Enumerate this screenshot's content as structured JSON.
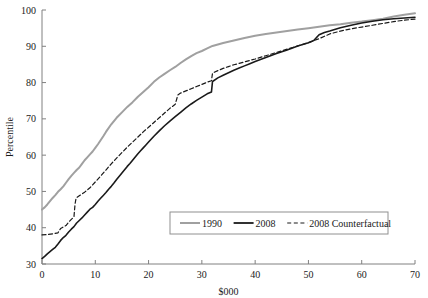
{
  "chart_data": {
    "type": "line",
    "title": "",
    "subtitle": "",
    "xlabel": "$000",
    "ylabel": "Percentile",
    "xlim": [
      0,
      70
    ],
    "ylim": [
      30,
      100
    ],
    "xticks": [
      0,
      10,
      20,
      30,
      40,
      50,
      60,
      70
    ],
    "yticks": [
      30,
      40,
      50,
      60,
      70,
      80,
      90,
      100
    ],
    "xtick_labels": [
      "0",
      "10",
      "20",
      "30",
      "40",
      "50",
      "60",
      "70"
    ],
    "ytick_labels": [
      "30",
      "40",
      "50",
      "60",
      "70",
      "80",
      "90",
      "100"
    ],
    "grid": false,
    "legend_position": "lower-right",
    "colors": {
      "series_1990": "#a0a0a0",
      "series_2008": "#1a1a1a",
      "series_2008_counterfactual": "#1a1a1a",
      "axis": "#808080",
      "text": "#1a1a1a",
      "background": "#ffffff"
    },
    "series": [
      {
        "name": "1990",
        "style": "solid",
        "color": "#a0a0a0",
        "x": [
          0,
          0.5,
          1,
          1.5,
          2,
          2.5,
          3,
          3.5,
          4,
          4.5,
          5,
          5.5,
          6,
          6.5,
          7,
          7.5,
          8,
          8.5,
          9,
          9.5,
          10,
          10.5,
          11,
          11.5,
          12,
          13,
          14,
          15,
          16,
          17,
          18,
          19,
          20,
          21,
          22,
          23,
          24,
          25,
          26,
          27,
          28,
          29,
          30,
          31,
          32,
          33,
          34,
          36,
          38,
          40,
          42,
          44,
          46,
          48,
          50,
          52,
          54,
          56,
          58,
          60,
          62,
          64,
          66,
          68,
          70
        ],
        "y": [
          45.0,
          45.6,
          46.4,
          47.3,
          48.2,
          49.0,
          49.9,
          50.6,
          51.4,
          52.4,
          53.4,
          54.3,
          55.1,
          55.9,
          56.6,
          57.6,
          58.6,
          59.4,
          60.2,
          61.0,
          62.0,
          63.0,
          64.1,
          65.2,
          66.4,
          68.5,
          70.3,
          71.8,
          73.3,
          74.6,
          76.1,
          77.4,
          78.7,
          80.2,
          81.4,
          82.4,
          83.4,
          84.3,
          85.4,
          86.4,
          87.3,
          88.1,
          88.7,
          89.4,
          90.1,
          90.5,
          90.9,
          91.6,
          92.3,
          92.9,
          93.4,
          93.8,
          94.2,
          94.6,
          95.0,
          95.4,
          95.8,
          96.1,
          96.5,
          96.8,
          97.2,
          97.6,
          98.2,
          98.7,
          99.1
        ]
      },
      {
        "name": "2008",
        "style": "solid",
        "color": "#1a1a1a",
        "x": [
          0,
          0.5,
          1,
          1.5,
          2,
          2.5,
          3,
          3.5,
          4,
          4.5,
          5,
          5.5,
          6,
          6.5,
          7,
          7.5,
          8,
          8.5,
          9,
          9.5,
          10,
          10.5,
          11,
          11.5,
          12,
          12.5,
          13,
          13.5,
          14,
          14.5,
          15,
          15.5,
          16,
          16.5,
          17,
          17.5,
          18,
          18.5,
          19,
          19.5,
          20,
          21,
          22,
          23,
          24,
          25,
          26,
          27,
          28,
          29,
          30,
          31,
          31.8,
          32,
          33,
          34,
          35,
          36,
          37,
          38,
          39,
          40,
          42,
          44,
          46,
          48,
          50,
          51,
          52,
          53,
          54,
          56,
          58,
          60,
          62,
          64,
          66,
          68,
          70
        ],
        "y": [
          31.5,
          32.1,
          32.8,
          33.4,
          34.0,
          34.6,
          35.5,
          36.5,
          37.3,
          37.9,
          38.8,
          39.6,
          40.3,
          41.3,
          42.0,
          42.7,
          43.5,
          44.3,
          45.1,
          45.6,
          46.4,
          47.3,
          48.1,
          48.9,
          49.7,
          50.6,
          51.4,
          52.3,
          53.3,
          54.2,
          55.1,
          56.0,
          56.9,
          57.7,
          58.6,
          59.5,
          60.4,
          61.2,
          62.0,
          62.8,
          63.6,
          65.2,
          66.7,
          68.1,
          69.4,
          70.6,
          71.8,
          73.0,
          74.1,
          75.1,
          76.0,
          76.9,
          77.4,
          80.3,
          81.3,
          82.0,
          82.7,
          83.4,
          84.0,
          84.6,
          85.2,
          85.8,
          86.9,
          88.0,
          89.0,
          90.1,
          91.0,
          91.6,
          93.2,
          93.8,
          94.2,
          95.1,
          95.8,
          96.4,
          96.9,
          97.3,
          97.6,
          97.8,
          98.0
        ]
      },
      {
        "name": "2008 Counterfactual",
        "style": "dashed",
        "color": "#1a1a1a",
        "x": [
          0,
          1,
          2,
          3,
          3.5,
          4,
          4.5,
          5,
          5.5,
          6,
          6.2,
          6.4,
          7,
          7.5,
          8,
          8.5,
          9,
          9.5,
          10,
          11,
          12,
          13,
          14,
          15,
          16,
          17,
          18,
          19,
          20,
          21,
          22,
          23,
          24,
          25,
          25.5,
          26,
          27,
          28,
          29,
          30,
          31,
          31.8,
          32,
          33,
          34,
          35,
          36,
          37,
          38,
          40,
          42,
          44,
          46,
          48,
          50,
          52,
          54,
          56,
          58,
          60,
          62,
          64,
          66,
          68,
          70
        ],
        "y": [
          38.0,
          38.1,
          38.3,
          38.6,
          39.8,
          40.2,
          40.6,
          41.5,
          42.3,
          43.0,
          46.5,
          48.2,
          48.8,
          49.3,
          49.8,
          50.4,
          51.0,
          51.8,
          52.6,
          54.2,
          55.9,
          57.6,
          59.2,
          60.7,
          62.2,
          63.6,
          65.0,
          66.4,
          67.7,
          69.0,
          70.3,
          71.6,
          72.9,
          74.0,
          76.6,
          77.1,
          77.7,
          78.3,
          78.9,
          79.5,
          80.1,
          80.5,
          82.6,
          83.3,
          83.9,
          84.4,
          84.9,
          85.3,
          85.7,
          86.5,
          87.4,
          88.3,
          89.2,
          90.1,
          91.0,
          92.1,
          93.4,
          94.2,
          94.8,
          95.3,
          95.8,
          96.3,
          96.8,
          97.2,
          97.5
        ]
      }
    ],
    "legend": [
      {
        "label": "1990",
        "style": "solid",
        "color": "#a0a0a0"
      },
      {
        "label": "2008",
        "style": "solid",
        "color": "#1a1a1a"
      },
      {
        "label": "2008 Counterfactual",
        "style": "dashed",
        "color": "#1a1a1a"
      }
    ]
  }
}
